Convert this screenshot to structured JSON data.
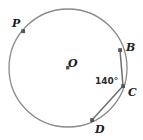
{
  "figure": {
    "background_color": "#ffffff",
    "stroke_color": "#8a8a8a",
    "chord_color": "#6e6e6e",
    "marker_color": "#555555",
    "label_color": "#1d1d1d"
  },
  "circle": {
    "center_label": "O",
    "center_x": 68,
    "center_y": 68,
    "radius": 59
  },
  "points": [
    {
      "label": "P",
      "x": 23,
      "y": 31
    },
    {
      "label": "B",
      "x": 120,
      "y": 50
    },
    {
      "label": "C",
      "x": 123,
      "y": 86
    },
    {
      "label": "D",
      "x": 92,
      "y": 120
    }
  ],
  "chords": [
    {
      "from": "B",
      "to": "C"
    },
    {
      "from": "C",
      "to": "D"
    }
  ],
  "angles": [
    {
      "vertex": "C",
      "value": "140°",
      "rays": [
        "B",
        "D"
      ]
    }
  ]
}
